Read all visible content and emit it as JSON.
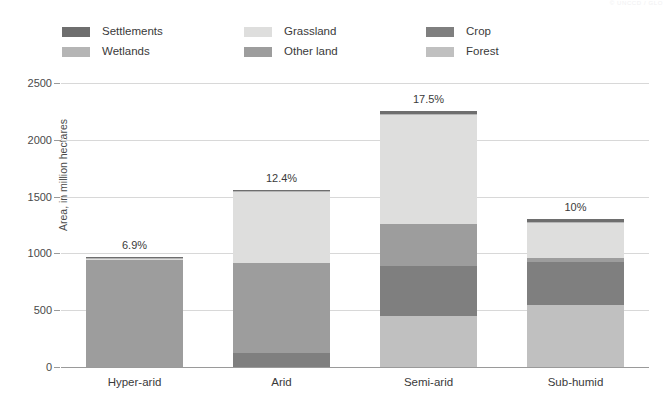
{
  "source_mark": "© UNCCD / GLO",
  "legend": {
    "columns": [
      [
        {
          "name": "Settlements",
          "color": "#6e6e6e"
        },
        {
          "name": "Wetlands",
          "color": "#b5b5b5"
        }
      ],
      [
        {
          "name": "Grassland",
          "color": "#dededd"
        },
        {
          "name": "Other land",
          "color": "#9d9d9d"
        }
      ],
      [
        {
          "name": "Crop",
          "color": "#7f7f7f"
        },
        {
          "name": "Forest",
          "color": "#c0c0c0"
        }
      ]
    ]
  },
  "chart_data": {
    "type": "bar",
    "subtype": "stacked-vertical",
    "title": "",
    "xlabel": "",
    "ylabel": "Area, in million hectares",
    "ylim": [
      0,
      2500
    ],
    "yticks": [
      0,
      500,
      1000,
      1500,
      2000,
      2500
    ],
    "ytick_labels": [
      "0",
      "500",
      "1000",
      "1500",
      "2000",
      "2500"
    ],
    "grid": true,
    "legend_position": "top",
    "categories": [
      "Hyper-arid",
      "Arid",
      "Semi-arid",
      "Sub-humid"
    ],
    "stack_order_bottom_to_top": [
      "Forest",
      "Crop",
      "Other land",
      "Grassland",
      "Wetlands",
      "Settlements"
    ],
    "series": [
      {
        "name": "Forest",
        "color": "#c0c0c0",
        "values": [
          0,
          0,
          450,
          545
        ]
      },
      {
        "name": "Crop",
        "color": "#7f7f7f",
        "values": [
          0,
          120,
          435,
          380
        ]
      },
      {
        "name": "Other land",
        "color": "#9d9d9d",
        "values": [
          940,
          795,
          375,
          35
        ]
      },
      {
        "name": "Grassland",
        "color": "#dededd",
        "values": [
          15,
          630,
          960,
          310
        ]
      },
      {
        "name": "Wetlands",
        "color": "#b5b5b5",
        "values": [
          5,
          5,
          10,
          10
        ]
      },
      {
        "name": "Settlements",
        "color": "#6e6e6e",
        "values": [
          5,
          10,
          25,
          25
        ]
      }
    ],
    "totals": [
      965,
      1560,
      2255,
      1305
    ],
    "annotations": [
      {
        "category": "Hyper-arid",
        "label": "6.9%",
        "value": 6.9
      },
      {
        "category": "Arid",
        "label": "12.4%",
        "value": 12.4
      },
      {
        "category": "Semi-arid",
        "label": "17.5%",
        "value": 17.5
      },
      {
        "category": "Sub-humid",
        "label": "10%",
        "value": 10.0
      }
    ]
  }
}
